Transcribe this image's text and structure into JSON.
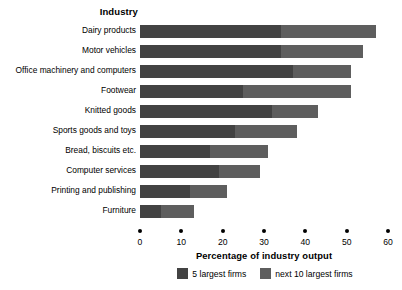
{
  "chart_data": {
    "type": "bar",
    "orientation": "horizontal",
    "stacked": true,
    "title": "",
    "category_axis_title": "Industry",
    "xlabel": "Percentage of industry output",
    "ylabel": "Industry",
    "xlim": [
      0,
      60
    ],
    "xticks": [
      0,
      10,
      20,
      30,
      40,
      50,
      60
    ],
    "xtick_labels": [
      "0",
      "10",
      "20",
      "30",
      "40",
      "50",
      "60"
    ],
    "grid": false,
    "legend_position": "bottom-center",
    "categories": [
      "Dairy products",
      "Motor vehicles",
      "Office machinery and computers",
      "Footwear",
      "Knitted goods",
      "Sports goods and toys",
      "Bread, biscuits etc.",
      "Computer services",
      "Printing and publishing",
      "Furniture"
    ],
    "series": [
      {
        "name": "5 largest firms",
        "color": "#434343",
        "values": [
          34,
          34,
          37,
          25,
          32,
          23,
          17,
          19,
          12,
          5
        ]
      },
      {
        "name": "next 10 largest firms",
        "color": "#5e5e5e",
        "values": [
          23,
          20,
          14,
          26,
          11,
          15,
          14,
          10,
          9,
          8
        ]
      }
    ],
    "totals": [
      57,
      54,
      51,
      51,
      43,
      38,
      31,
      29,
      21,
      13
    ]
  },
  "legend": {
    "items": [
      {
        "label": "5 largest firms",
        "color": "#434343"
      },
      {
        "label": "next 10 largest firms",
        "color": "#5e5e5e"
      }
    ]
  }
}
